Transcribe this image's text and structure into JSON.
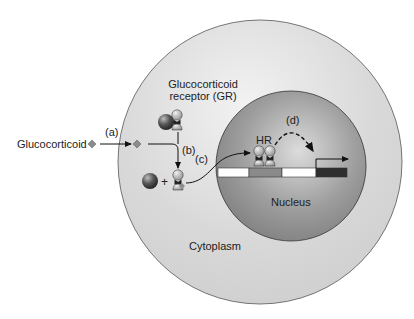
{
  "labels": {
    "glucocorticoid": "Glucocorticoid",
    "receptor_line1": "Glucocorticoid",
    "receptor_line2": "receptor (GR)",
    "step_a": "(a)",
    "step_b": "(b)",
    "step_c": "(c)",
    "step_d": "(d)",
    "hr": "HR",
    "nucleus": "Nucleus",
    "cytoplasm": "Cytoplasm",
    "plus": "+"
  },
  "colors": {
    "cell": "#d6d6d6",
    "cell_highlight": "#efefef",
    "nucleus": "#8f8f8f",
    "nucleus_highlight": "#d8d8d8",
    "dna_white": "#ffffff",
    "dna_gray": "#8a8a8a",
    "dna_dark": "#2e2e2e",
    "hormone": "#8c8c8c",
    "line": "#111111"
  }
}
